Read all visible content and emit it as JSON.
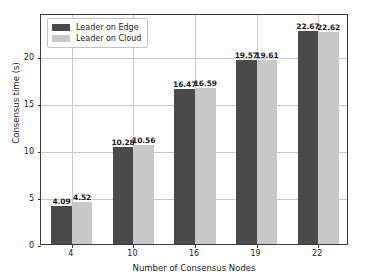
{
  "chart_data": {
    "type": "bar",
    "title": "",
    "xlabel": "Number of Consensus Nodes",
    "ylabel": "Consensus time (s)",
    "categories": [
      "4",
      "10",
      "16",
      "19",
      "22"
    ],
    "series": [
      {
        "name": "Leader on Edge",
        "color": "#4a4a4a",
        "values": [
          4.09,
          10.28,
          16.47,
          19.57,
          22.67
        ],
        "labels": [
          "4.09",
          "10.28",
          "16.47",
          "19.57",
          "22.67"
        ]
      },
      {
        "name": "Leader on Cloud",
        "color": "#c8c8c8",
        "values": [
          4.52,
          10.56,
          16.59,
          19.61,
          22.62
        ],
        "labels": [
          "4.52",
          "10.56",
          "16.59",
          "19.61",
          "22.62"
        ]
      }
    ],
    "ylim": [
      0,
      24.6
    ],
    "yticks": [
      0,
      5,
      10,
      15,
      20
    ],
    "ytick_labels": [
      "0",
      "5",
      "10",
      "15",
      "20"
    ],
    "grid": true,
    "grid_axis": "both",
    "legend_position": "upper left"
  },
  "legend": {
    "entries": [
      {
        "label": "Leader on Edge"
      },
      {
        "label": "Leader on Cloud"
      }
    ]
  },
  "colors": {
    "edge": "#4a4a4a",
    "cloud": "#c8c8c8",
    "grid": "#c9c9c9",
    "axis": "#3a3a3a",
    "background": "#ffffff"
  }
}
